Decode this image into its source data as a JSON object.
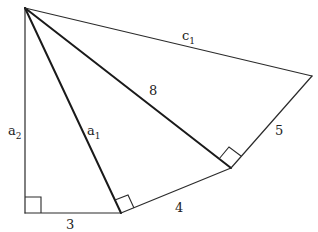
{
  "diagram": {
    "type": "spiral-of-right-triangles",
    "vertices": {
      "A": [
        25,
        8
      ],
      "B": [
        25,
        213
      ],
      "C": [
        121,
        213
      ],
      "D": [
        231,
        168
      ],
      "E": [
        312,
        76
      ]
    },
    "segments": [
      {
        "id": "a2",
        "from": "A",
        "to": "B",
        "label": "a",
        "sub": "2"
      },
      {
        "id": "bottom",
        "from": "B",
        "to": "C",
        "label": "3",
        "sub": ""
      },
      {
        "id": "a1",
        "from": "A",
        "to": "C",
        "label": "a",
        "sub": "1"
      },
      {
        "id": "cd",
        "from": "C",
        "to": "D",
        "label": "4",
        "sub": ""
      },
      {
        "id": "ad",
        "from": "A",
        "to": "D",
        "label": "8",
        "sub": ""
      },
      {
        "id": "de",
        "from": "D",
        "to": "E",
        "label": "5",
        "sub": ""
      },
      {
        "id": "c1",
        "from": "A",
        "to": "E",
        "label": "c",
        "sub": "1"
      }
    ],
    "labels": {
      "a2": {
        "main": "a",
        "sub": "2"
      },
      "a1": {
        "main": "a",
        "sub": "1"
      },
      "c1": {
        "main": "c",
        "sub": "1"
      },
      "side_8": "8",
      "side_5": "5",
      "side_4": "4",
      "side_3": "3"
    },
    "right_angles": [
      "B",
      "C",
      "D"
    ],
    "stroke_color": "#2b2b2b",
    "background": "#ffffff"
  }
}
